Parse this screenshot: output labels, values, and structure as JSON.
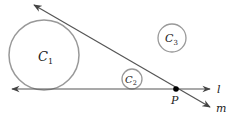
{
  "diagram": {
    "circles": [
      {
        "id": "C1",
        "label_main": "C",
        "label_sub": "1",
        "cx": 44,
        "cy": 55,
        "r": 35
      },
      {
        "id": "C2",
        "label_main": "C",
        "label_sub": "2",
        "cx": 132,
        "cy": 79,
        "r": 10
      },
      {
        "id": "C3",
        "label_main": "C",
        "label_sub": "3",
        "cx": 172,
        "cy": 38,
        "r": 14
      }
    ],
    "lines": [
      {
        "id": "l",
        "label": "l",
        "x1": 212,
        "y1": 89,
        "x2": 10,
        "y2": 89
      },
      {
        "id": "m",
        "label": "m",
        "x1": 32,
        "y1": 4,
        "x2": 212,
        "y2": 108
      }
    ],
    "point": {
      "id": "P",
      "label": "P",
      "x": 176,
      "y": 89
    },
    "colors": {
      "circle_stroke": "#999999",
      "line_stroke": "#444444",
      "point_fill": "#000000",
      "text": "#222222"
    }
  }
}
